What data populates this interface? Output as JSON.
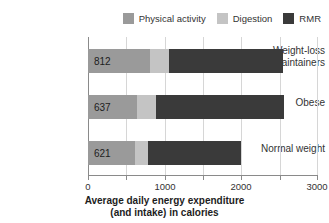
{
  "chart_data": {
    "type": "bar",
    "orientation": "horizontal",
    "stacked": true,
    "title": "",
    "subtitle": "",
    "xlabel_line1": "Average daily energy expenditure",
    "xlabel_line2": "(and intake) in calories",
    "ylabel": "",
    "categories": [
      "Weight-loss maintainers",
      "Obese",
      "Normal weight"
    ],
    "series": [
      {
        "name": "Physical activity",
        "color": "#9a9a9a",
        "values": [
          812,
          637,
          621
        ]
      },
      {
        "name": "Digestion",
        "color": "#c4c4c4",
        "values": [
          248,
          253,
          159
        ]
      },
      {
        "name": "RMR",
        "color": "#3a3a3a",
        "values": [
          1490,
          1680,
          1220
        ]
      }
    ],
    "totals": [
      2550,
      2570,
      2000
    ],
    "xlim": [
      0,
      3000
    ],
    "xticks": [
      0,
      500,
      1000,
      1500,
      2000,
      2500,
      3000
    ],
    "xtick_labels": [
      "0",
      "",
      "1000",
      "",
      "2000",
      "",
      "3000"
    ],
    "grid": true,
    "legend_position": "top-right",
    "value_labels_series": "Physical activity",
    "value_labels": [
      "812",
      "637",
      "621"
    ]
  },
  "legend": {
    "items": [
      {
        "label": "Physical activity",
        "color": "#9a9a9a",
        "swatch_name": "legend-swatch-physical-activity"
      },
      {
        "label": "Digestion",
        "color": "#c4c4c4",
        "swatch_name": "legend-swatch-digestion"
      },
      {
        "label": "RMR",
        "color": "#3a3a3a",
        "swatch_name": "legend-swatch-rmr"
      }
    ]
  },
  "axis": {
    "tick_labels": [
      "0",
      "1000",
      "2000",
      "3000"
    ],
    "tick_values": [
      0,
      1000,
      2000,
      3000
    ],
    "title_line1": "Average daily energy expenditure",
    "title_line2": "(and intake) in calories",
    "axis_color": "#8a8a8a",
    "grid_color": "#d6d6d6"
  },
  "categories": {
    "items": [
      {
        "label_line1": "Weight-loss",
        "label_line2": "maintainers"
      },
      {
        "label_line1": "Obese",
        "label_line2": ""
      },
      {
        "label_line1": "Normal weight",
        "label_line2": ""
      }
    ]
  },
  "bars": [
    {
      "category": "Weight-loss maintainers",
      "value_label": "812",
      "segments": [
        {
          "series": "Physical activity",
          "value": 812,
          "color": "#9a9a9a"
        },
        {
          "series": "Digestion",
          "value": 248,
          "color": "#c4c4c4"
        },
        {
          "series": "RMR",
          "value": 1490,
          "color": "#3a3a3a"
        }
      ]
    },
    {
      "category": "Obese",
      "value_label": "637",
      "segments": [
        {
          "series": "Physical activity",
          "value": 637,
          "color": "#9a9a9a"
        },
        {
          "series": "Digestion",
          "value": 253,
          "color": "#c4c4c4"
        },
        {
          "series": "RMR",
          "value": 1680,
          "color": "#3a3a3a"
        }
      ]
    },
    {
      "category": "Normal weight",
      "value_label": "621",
      "segments": [
        {
          "series": "Physical activity",
          "value": 621,
          "color": "#9a9a9a"
        },
        {
          "series": "Digestion",
          "value": 159,
          "color": "#c4c4c4"
        },
        {
          "series": "RMR",
          "value": 1220,
          "color": "#3a3a3a"
        }
      ]
    }
  ]
}
